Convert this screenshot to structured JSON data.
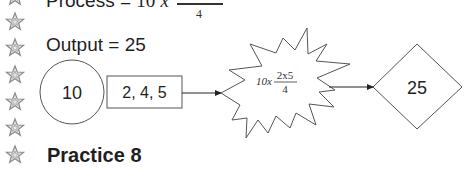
{
  "process_line": {
    "prefix": "Process = ",
    "multiplier": "10",
    "times": "x",
    "denominator": "4"
  },
  "output_line": {
    "text": "Output = 25"
  },
  "diagram": {
    "input_circle": "10",
    "values_box": "2, 4, 5",
    "process_burst": {
      "multiplier": "10x",
      "numerator": "2x5",
      "denominator": "4"
    },
    "output_diamond": "25",
    "stroke_color": "#555555",
    "arrow_color": "#222222"
  },
  "heading": {
    "text": "Practice 8"
  },
  "margin": {
    "icon": "star-icon",
    "count": 7,
    "color": "#9a9a9a"
  }
}
